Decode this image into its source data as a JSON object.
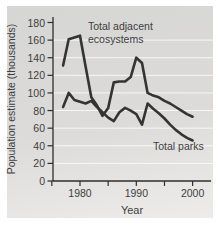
{
  "chart_data": {
    "type": "line",
    "title": "",
    "xlabel": "Year",
    "ylabel": "Population estimate (thousands)",
    "ylim": [
      0,
      180
    ],
    "xlim": [
      1975,
      2003
    ],
    "grid": "horizontal white gridlines on gray panel",
    "legend_position": "inline annotations",
    "y_ticks": [
      0,
      20,
      40,
      60,
      80,
      100,
      120,
      140,
      160,
      180
    ],
    "y_gridlines": [
      20,
      40,
      60,
      80,
      100,
      120,
      140,
      160
    ],
    "x_ticks": [
      {
        "year": 1975,
        "label": ""
      },
      {
        "year": 1980,
        "label": "1980"
      },
      {
        "year": 1985,
        "label": ""
      },
      {
        "year": 1990,
        "label": "1990"
      },
      {
        "year": 1995,
        "label": ""
      },
      {
        "year": 2000,
        "label": "2000"
      }
    ],
    "years": [
      1977,
      1978,
      1979,
      1980,
      1981,
      1982,
      1983,
      1984,
      1985,
      1986,
      1987,
      1988,
      1989,
      1990,
      1991,
      1992,
      1993,
      1994,
      1995,
      1996,
      1997,
      1998,
      1999,
      2000
    ],
    "series": [
      {
        "name": "Total adjacent ecosystems",
        "values": [
          131,
          161,
          163,
          165,
          130,
          95,
          86,
          74,
          83,
          112,
          113,
          113,
          118,
          140,
          134,
          100,
          97,
          95,
          91,
          88,
          84,
          80,
          76,
          73
        ]
      },
      {
        "name": "Total parks",
        "values": [
          84,
          100,
          92,
          90,
          88,
          91,
          84,
          78,
          72,
          68,
          78,
          83,
          80,
          76,
          64,
          88,
          82,
          77,
          71,
          64,
          58,
          53,
          49,
          46
        ]
      }
    ],
    "annotations": [
      {
        "name": "total-adjacent-ecosystems-label",
        "lines": [
          "Total adjacent",
          "ecosystems"
        ],
        "x": 88,
        "y": 20
      },
      {
        "name": "total-parks-label",
        "lines": [
          "Total parks"
        ],
        "x": 153,
        "y": 140
      }
    ]
  },
  "colors": {
    "panel_top": "#d6d6d4",
    "panel_mid": "#dcdbd9",
    "panel_bottom": "#edecea",
    "gridline": "#ffffff",
    "axis": "#2e2e2e",
    "text": "#3e3e3e",
    "series_line": "#343434"
  }
}
